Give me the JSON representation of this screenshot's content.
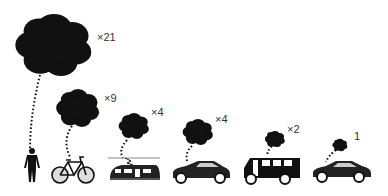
{
  "diagram": {
    "items": [
      {
        "mode": "pedestrian",
        "multiplier": "×21"
      },
      {
        "mode": "bicycle",
        "multiplier": "×9"
      },
      {
        "mode": "train",
        "multiplier": "×4"
      },
      {
        "mode": "car",
        "multiplier": "×4"
      },
      {
        "mode": "bus",
        "multiplier": "×2"
      },
      {
        "mode": "shared-car",
        "multiplier": "1"
      }
    ],
    "colors": {
      "cloud": "#111111",
      "vehicle": "#222222",
      "label": "#333333"
    }
  }
}
